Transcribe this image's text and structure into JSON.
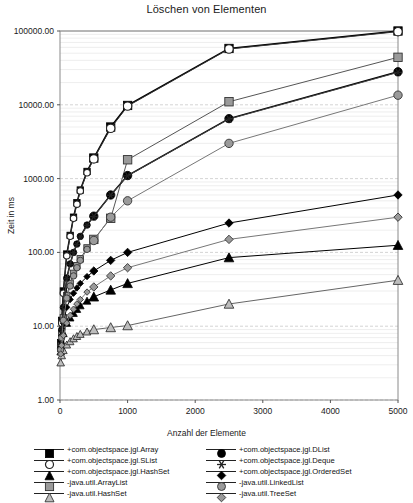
{
  "chart_data": {
    "type": "line",
    "title": "Löschen von Elementen",
    "xlabel": "Anzahl der Elemente",
    "ylabel": "Zeit in ms",
    "xlim": [
      0,
      5000
    ],
    "ylim": [
      1.0,
      100000.0
    ],
    "yscale": "log",
    "xscale": "linear",
    "grid": true,
    "legend_position": "bottom",
    "xticks": [
      0,
      1000,
      2000,
      3000,
      4000,
      5000
    ],
    "xticklabels": [
      "0",
      "1000",
      "2000",
      "3000",
      "4000",
      "5000"
    ],
    "yticks": [
      1.0,
      10.0,
      100.0,
      1000.0,
      10000.0,
      100000.0
    ],
    "yticklabels": [
      "1.00",
      "10.00",
      "100.00",
      "1000.00",
      "10000.00",
      "100000.00"
    ],
    "x": [
      10,
      25,
      50,
      100,
      150,
      200,
      250,
      300,
      400,
      500,
      750,
      1000,
      2500,
      5000
    ],
    "series": [
      {
        "name": "+com.objectspace.jgl.Array",
        "marker": "filled-square",
        "color": "#000000",
        "values": [
          6,
          12,
          30,
          95,
          170,
          300,
          470,
          700,
          1250,
          1900,
          5000,
          9800,
          58000,
          100000
        ]
      },
      {
        "name": "+com.objectspace.jgl.SList",
        "marker": "open-circle",
        "color": "#333333",
        "values": [
          5.5,
          11,
          28,
          90,
          165,
          290,
          450,
          680,
          1200,
          1850,
          4800,
          9600,
          57000,
          98000
        ]
      },
      {
        "name": "+com.objectspace.jgl.HashSet",
        "marker": "filled-triangle",
        "color": "#000000",
        "values": [
          4.5,
          6,
          8,
          11,
          13,
          15,
          17,
          19,
          22,
          25,
          31,
          38,
          85,
          125
        ]
      },
      {
        "name": "-java.util.ArrayList",
        "marker": "gray-square",
        "color": "#555555",
        "values": [
          5,
          8,
          13,
          26,
          38,
          52,
          66,
          82,
          115,
          150,
          290,
          1800,
          11000,
          44000
        ]
      },
      {
        "name": "-java.util.HashSet",
        "marker": "open-triangle",
        "color": "#666666",
        "values": [
          3.2,
          4,
          4.7,
          5.6,
          6.2,
          6.8,
          7.3,
          7.8,
          8.4,
          9,
          9.6,
          10.2,
          20,
          42
        ]
      },
      {
        "name": "+com.objectspace.jgl.DList",
        "marker": "filled-circle",
        "color": "#000000",
        "values": [
          5,
          9,
          18,
          45,
          70,
          100,
          130,
          165,
          235,
          310,
          600,
          1100,
          6500,
          28000
        ]
      },
      {
        "name": "+com.objectspace.jgl.Deque",
        "marker": "star",
        "color": "#444444",
        "values": [
          5,
          9,
          18,
          44,
          69,
          99,
          128,
          162,
          232,
          305,
          595,
          1090,
          6400,
          27500
        ]
      },
      {
        "name": "+com.objectspace.jgl.OrderedSet",
        "marker": "filled-diamond",
        "color": "#000000",
        "values": [
          5,
          7.5,
          11,
          18,
          23,
          28,
          33,
          38,
          47,
          56,
          78,
          100,
          250,
          600
        ]
      },
      {
        "name": "-java.util.LinkedList",
        "marker": "gray-circle",
        "color": "#777777",
        "values": [
          4.8,
          7,
          12,
          24,
          35,
          48,
          62,
          78,
          110,
          145,
          300,
          500,
          3000,
          13500
        ]
      },
      {
        "name": "-java.util.TreeSet",
        "marker": "gray-diamond",
        "color": "#777777",
        "values": [
          4.2,
          5.5,
          7.5,
          11,
          14,
          17,
          20,
          23,
          29,
          34,
          48,
          62,
          150,
          300
        ]
      }
    ]
  },
  "legend": {
    "left_column": [
      {
        "label": "+com.objectspace.jgl.Array",
        "marker": "filled-square"
      },
      {
        "label": "+com.objectspace.jgl.SList",
        "marker": "open-circle"
      },
      {
        "label": "+com.objectspace.jgl.HashSet",
        "marker": "filled-triangle"
      },
      {
        "label": "-java.util.ArrayList",
        "marker": "gray-square"
      },
      {
        "label": "-java.util.HashSet",
        "marker": "open-triangle"
      }
    ],
    "right_column": [
      {
        "label": "+com.objectspace.jgl.DList",
        "marker": "filled-circle"
      },
      {
        "label": "+com.objectspace.jgl.Deque",
        "marker": "star"
      },
      {
        "label": "+com.objectspace.jgl.OrderedSet",
        "marker": "filled-diamond"
      },
      {
        "label": "-java.util.LinkedList",
        "marker": "gray-circle"
      },
      {
        "label": "-java.util.TreeSet",
        "marker": "gray-diamond"
      }
    ]
  }
}
